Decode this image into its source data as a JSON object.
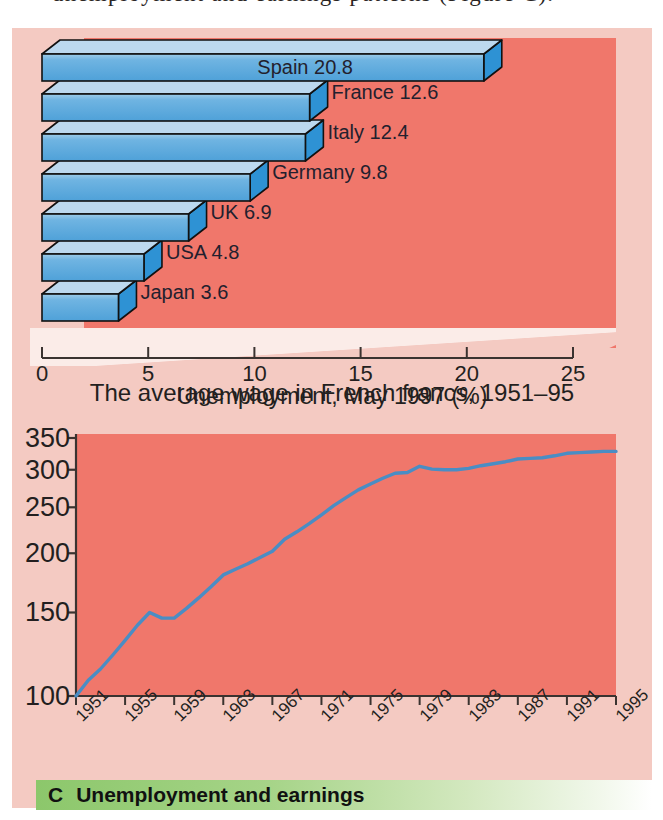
{
  "page": {
    "top_text_fragment": "unemployment and earnings patterns (Figure C)."
  },
  "colors": {
    "plot_background": "#f0776b",
    "panel_background": "#f4cac2",
    "bar_front": "#5aa9dd",
    "bar_top": "#bcd9ef",
    "bar_side": "#2e92d4",
    "line_stroke": "#4a8dc4",
    "banner_green": "#8cc76b",
    "text": "#231f20"
  },
  "chart_data": [
    {
      "type": "bar",
      "orientation": "horizontal",
      "title": "",
      "xlabel": "Unemployment, May 1997 (%)",
      "ylabel": "",
      "xlim": [
        0,
        25
      ],
      "xticks": [
        "0",
        "5",
        "10",
        "15",
        "20",
        "25"
      ],
      "xtick_values": [
        0,
        5,
        10,
        15,
        20,
        25
      ],
      "grid": false,
      "legend": "none",
      "categories": [
        "Spain",
        "France",
        "Italy",
        "Germany",
        "UK",
        "USA",
        "Japan"
      ],
      "values": [
        20.8,
        12.6,
        12.4,
        9.8,
        6.9,
        4.8,
        3.6
      ],
      "bar_labels": [
        "Spain 20.8",
        "France 12.6",
        "Italy 12.4",
        "Germany 9.8",
        "UK 6.9",
        "USA 4.8",
        "Japan 3.6"
      ]
    },
    {
      "type": "line",
      "title": "",
      "xlabel": "The average wage in French francs, 1951–95",
      "ylabel": "",
      "yscale": "log",
      "ylim": [
        100,
        350
      ],
      "yticks": [
        "100",
        "150",
        "200",
        "250",
        "300",
        "350"
      ],
      "ytick_values": [
        100,
        150,
        200,
        250,
        300,
        350
      ],
      "xlim": [
        1951,
        1995
      ],
      "xticks": [
        "1951",
        "1955",
        "1959",
        "1963",
        "1967",
        "1971",
        "1975",
        "1979",
        "1983",
        "1987",
        "1991",
        "1995"
      ],
      "xtick_values": [
        1951,
        1955,
        1959,
        1963,
        1967,
        1971,
        1975,
        1979,
        1983,
        1987,
        1991,
        1995
      ],
      "grid": false,
      "legend": "none",
      "series": [
        {
          "name": "Average wage (French francs, index)",
          "x": [
            1951,
            1952,
            1953,
            1954,
            1955,
            1956,
            1957,
            1958,
            1959,
            1960,
            1961,
            1962,
            1963,
            1964,
            1965,
            1966,
            1967,
            1968,
            1969,
            1970,
            1971,
            1972,
            1973,
            1974,
            1975,
            1976,
            1977,
            1978,
            1979,
            1980,
            1981,
            1982,
            1983,
            1984,
            1985,
            1986,
            1987,
            1988,
            1989,
            1990,
            1991,
            1992,
            1993,
            1994,
            1995
          ],
          "values": [
            100,
            108,
            114,
            122,
            131,
            141,
            150,
            146,
            146,
            153,
            161,
            170,
            180,
            185,
            190,
            196,
            202,
            214,
            222,
            231,
            241,
            252,
            262,
            272,
            280,
            288,
            295,
            296,
            305,
            301,
            300,
            300,
            302,
            306,
            309,
            312,
            316,
            317,
            318,
            321,
            325,
            326,
            327,
            328,
            328
          ]
        }
      ]
    }
  ],
  "caption": {
    "letter": "C",
    "text": "Unemployment and earnings"
  }
}
